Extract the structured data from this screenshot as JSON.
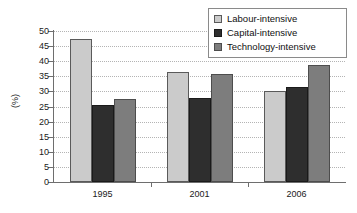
{
  "chart_data": {
    "type": "bar",
    "title": "",
    "subtitle": "",
    "xlabel": "",
    "ylabel": "(%)",
    "categories": [
      "1995",
      "2001",
      "2006"
    ],
    "series": [
      {
        "name": "Labour-intensive",
        "color": "#cbcbcb",
        "values": [
          47.2,
          36.5,
          30.3
        ]
      },
      {
        "name": "Capital-intensive",
        "color": "#2e2e2e",
        "values": [
          25.6,
          27.9,
          31.5
        ]
      },
      {
        "name": "Technology-intensive",
        "color": "#7d7d7d",
        "values": [
          27.5,
          35.8,
          38.7
        ]
      }
    ],
    "ylim": [
      0,
      50
    ],
    "ytick_values": [
      0,
      5,
      10,
      15,
      20,
      25,
      30,
      35,
      40,
      45,
      50
    ],
    "ytick_labels": [
      "0",
      "5",
      "10",
      "15",
      "20",
      "25",
      "30",
      "35",
      "40",
      "45",
      "50"
    ],
    "grid": true,
    "grid_axis": "y",
    "legend_position": "top-right",
    "legend_entries": [
      "Labour-intensive",
      "Capital-intensive",
      "Technology-intensive"
    ]
  },
  "legend": {
    "items": [
      {
        "label": "Labour-intensive"
      },
      {
        "label": "Capital-intensive"
      },
      {
        "label": "Technology-intensive"
      }
    ]
  }
}
